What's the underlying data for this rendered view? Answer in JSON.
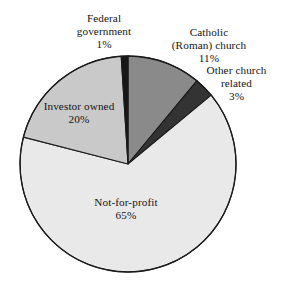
{
  "chart_data": {
    "type": "pie",
    "title": "",
    "subtitle": "",
    "xlabel": "",
    "ylabel": "",
    "legend_position": "none",
    "grid": false,
    "units": "percent",
    "total": 100,
    "categories": [
      "Catholic (Roman) church",
      "Other church related",
      "Not-for-profit",
      "Investor owned",
      "Federal government"
    ],
    "values": [
      11,
      3,
      65,
      20,
      1
    ],
    "slices": [
      {
        "name": "catholic-roman-church",
        "label_lines": [
          "Catholic",
          "(Roman) church"
        ],
        "value": 11,
        "value_text": "11%",
        "color": "#8a8a8a",
        "label_placement": "outside"
      },
      {
        "name": "other-church-related",
        "label_lines": [
          "Other church",
          "related"
        ],
        "value": 3,
        "value_text": "3%",
        "color": "#333333",
        "label_placement": "outside"
      },
      {
        "name": "not-for-profit",
        "label_lines": [
          "Not-for-profit"
        ],
        "value": 65,
        "value_text": "65%",
        "color": "#e9e9e9",
        "label_placement": "inside"
      },
      {
        "name": "investor-owned",
        "label_lines": [
          "Investor owned"
        ],
        "value": 20,
        "value_text": "20%",
        "color": "#c9c9c9",
        "label_placement": "inside"
      },
      {
        "name": "federal-government",
        "label_lines": [
          "Federal",
          "government"
        ],
        "value": 1,
        "value_text": "1%",
        "color": "#171717",
        "label_placement": "outside"
      }
    ],
    "geometry": {
      "center_x": 128,
      "center_y": 164,
      "radius": 108,
      "start_angle_deg": 0,
      "direction": "clockwise"
    },
    "stroke_color": "#1a1a1a",
    "background": "#ffffff"
  },
  "labels": {
    "federal_government": {
      "line1": "Federal",
      "line2": "government",
      "pct": "1%"
    },
    "catholic_church": {
      "line1": "Catholic",
      "line2": "(Roman) church",
      "pct": "11%"
    },
    "other_church_related": {
      "line1": "Other church",
      "line2": "related",
      "pct": "3%"
    },
    "investor_owned": {
      "line1": "Investor owned",
      "pct": "20%"
    },
    "not_for_profit": {
      "line1": "Not-for-profit",
      "pct": "65%"
    }
  }
}
